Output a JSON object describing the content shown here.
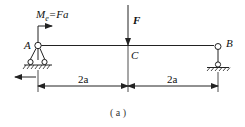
{
  "figure": {
    "caption": "( a )",
    "colors": {
      "line": "#222222",
      "background": "#ffffff"
    }
  },
  "beam": {
    "points": {
      "A": {
        "label": "A"
      },
      "B": {
        "label": "B"
      },
      "C": {
        "label": "C"
      }
    }
  },
  "loads": {
    "force": {
      "label": "F"
    },
    "moment": {
      "label_main": "M",
      "label_sub": "e",
      "label_rest": "=Fa"
    }
  },
  "dimensions": [
    {
      "label": "2a"
    },
    {
      "label": "2a"
    }
  ]
}
